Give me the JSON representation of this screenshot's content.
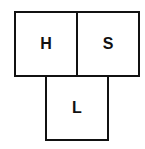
{
  "diagram": {
    "boxes": [
      {
        "id": "H",
        "label": "H",
        "position": "top-left"
      },
      {
        "id": "S",
        "label": "S",
        "position": "top-right"
      },
      {
        "id": "L",
        "label": "L",
        "position": "bottom-center"
      }
    ]
  },
  "colors": {
    "border": "#111111",
    "text": "#111111",
    "background": "#ffffff"
  }
}
